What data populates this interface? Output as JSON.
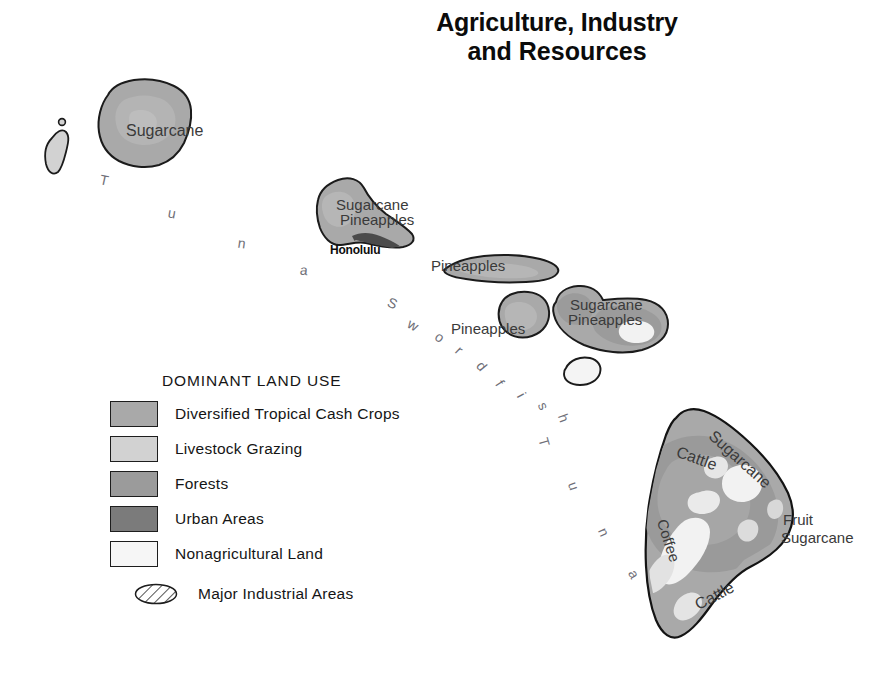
{
  "title": {
    "line1": "Agriculture, Industry",
    "line2": "and Resources"
  },
  "legend": {
    "heading": "DOMINANT LAND USE",
    "items": [
      {
        "label": "Diversified Tropical Cash Crops",
        "color": "#a9a9a9"
      },
      {
        "label": "Livestock Grazing",
        "color": "#d2d2d2"
      },
      {
        "label": "Forests",
        "color": "#9b9b9b"
      },
      {
        "label": "Urban Areas",
        "color": "#7b7b7b"
      },
      {
        "label": "Nonagricultural Land",
        "color": "#f4f4f4"
      }
    ],
    "industrial": {
      "label": "Major Industrial Areas",
      "pattern": "diagonal-hatch"
    }
  },
  "map": {
    "islands": [
      {
        "name": "Niihau",
        "labels": []
      },
      {
        "name": "Kauai",
        "labels": [
          "Sugarcane"
        ]
      },
      {
        "name": "Oahu",
        "labels": [
          "Sugarcane",
          "Pineapples"
        ],
        "city": "Honolulu"
      },
      {
        "name": "Molokai",
        "labels": [
          "Pineapples"
        ]
      },
      {
        "name": "Lanai",
        "labels": [
          "Pineapples"
        ]
      },
      {
        "name": "Maui",
        "labels": [
          "Sugarcane",
          "Pineapples"
        ]
      },
      {
        "name": "Kahoolawe",
        "labels": []
      },
      {
        "name": "Hawaii",
        "labels": [
          "Sugarcane",
          "Cattle",
          "Fruit",
          "Sugarcane",
          "Coffee",
          "Cattle"
        ]
      }
    ],
    "labels": [
      {
        "id": "kauai-sugarcane",
        "text": "Sugarcane",
        "x": 126,
        "y": 122,
        "size": 16,
        "rotate": 0
      },
      {
        "id": "oahu-sugarcane",
        "text": "Sugarcane",
        "x": 336,
        "y": 196,
        "size": 15,
        "rotate": 0
      },
      {
        "id": "oahu-pineapples",
        "text": "Pineapples",
        "x": 340,
        "y": 211,
        "size": 15,
        "rotate": 0
      },
      {
        "id": "honolulu-city",
        "text": "Honolulu",
        "x": 330,
        "y": 243,
        "size": 12,
        "rotate": 0
      },
      {
        "id": "molokai-pineapples",
        "text": "Pineapples",
        "x": 431,
        "y": 257,
        "size": 15,
        "rotate": 0
      },
      {
        "id": "lanai-pineapples",
        "text": "Pineapples",
        "x": 451,
        "y": 320,
        "size": 15,
        "rotate": 0
      },
      {
        "id": "maui-sugarcane",
        "text": "Sugarcane",
        "x": 570,
        "y": 296,
        "size": 15,
        "rotate": 0
      },
      {
        "id": "maui-pineapples",
        "text": "Pineapples",
        "x": 568,
        "y": 311,
        "size": 15,
        "rotate": 0
      },
      {
        "id": "hawaii-sugarcane-n",
        "text": "Sugarcane",
        "x": 717,
        "y": 427,
        "size": 16,
        "rotate": 42
      },
      {
        "id": "hawaii-cattle-n",
        "text": "Cattle",
        "x": 680,
        "y": 443,
        "size": 16,
        "rotate": 20
      },
      {
        "id": "hawaii-fruit",
        "text": "Fruit",
        "x": 783,
        "y": 511,
        "size": 15,
        "rotate": 0
      },
      {
        "id": "hawaii-sugarcane-e",
        "text": "Sugarcane",
        "x": 781,
        "y": 529,
        "size": 15,
        "rotate": 0
      },
      {
        "id": "hawaii-coffee",
        "text": "Coffee",
        "x": 670,
        "y": 517,
        "size": 15,
        "rotate": 72
      },
      {
        "id": "hawaii-cattle-s",
        "text": "Cattle",
        "x": 692,
        "y": 598,
        "size": 16,
        "rotate": -28
      }
    ],
    "ocean_labels": [
      {
        "id": "tuna-northwest",
        "text": "Tuna",
        "letters": [
          {
            "ch": "T",
            "x": 100,
            "y": 172,
            "rot": 12
          },
          {
            "ch": "u",
            "x": 168,
            "y": 205,
            "rot": 10
          },
          {
            "ch": "n",
            "x": 238,
            "y": 235,
            "rot": 8
          },
          {
            "ch": "a",
            "x": 300,
            "y": 262,
            "rot": 6
          }
        ]
      },
      {
        "id": "swordfish",
        "text": "Swordfish",
        "letters": [
          {
            "ch": "S",
            "x": 388,
            "y": 295,
            "rot": 24
          },
          {
            "ch": "w",
            "x": 408,
            "y": 317,
            "rot": 30
          },
          {
            "ch": "o",
            "x": 436,
            "y": 329,
            "rot": 36
          },
          {
            "ch": "r",
            "x": 457,
            "y": 342,
            "rot": 44
          },
          {
            "ch": "d",
            "x": 478,
            "y": 358,
            "rot": 50
          },
          {
            "ch": "f",
            "x": 498,
            "y": 375,
            "rot": 56
          },
          {
            "ch": "i",
            "x": 520,
            "y": 387,
            "rot": 62
          },
          {
            "ch": "s",
            "x": 540,
            "y": 398,
            "rot": 66
          },
          {
            "ch": "h",
            "x": 560,
            "y": 410,
            "rot": 70
          }
        ]
      },
      {
        "id": "tuna-southeast",
        "text": "Tuna",
        "letters": [
          {
            "ch": "T",
            "x": 540,
            "y": 434,
            "rot": 74
          },
          {
            "ch": "u",
            "x": 570,
            "y": 478,
            "rot": 70
          },
          {
            "ch": "n",
            "x": 600,
            "y": 524,
            "rot": 66
          },
          {
            "ch": "a",
            "x": 630,
            "y": 566,
            "rot": 62
          }
        ]
      }
    ]
  }
}
